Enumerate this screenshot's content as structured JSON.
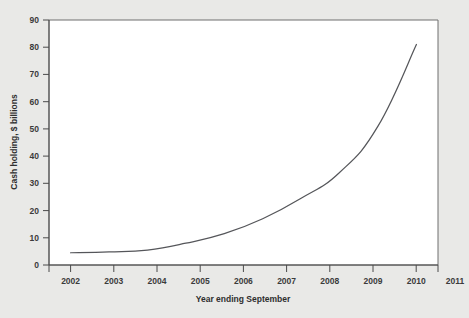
{
  "chart_data": {
    "type": "line",
    "title": "",
    "xlabel": "Year ending September",
    "ylabel": "Cash holding, $ billions",
    "categories": [
      "2002",
      "2003",
      "2004",
      "2005",
      "2006",
      "2007",
      "2008",
      "2009",
      "2010",
      "2011"
    ],
    "x": [
      2002,
      2003,
      2004,
      2005,
      2006,
      2007,
      2008,
      2009,
      2010,
      2011
    ],
    "values": [
      4.5,
      4.8,
      5.5,
      8.0,
      11.5,
      17.0,
      24.5,
      34.0,
      51.0,
      81.0
    ],
    "series": [
      {
        "name": "Cash holding",
        "values": [
          4.5,
          4.8,
          5.5,
          8.0,
          11.5,
          17.0,
          24.5,
          34.0,
          51.0,
          81.0
        ],
        "color": "#55565a"
      }
    ],
    "ylim": [
      0,
      90
    ],
    "xlim": [
      2002,
      2011
    ],
    "yticks": [
      0,
      10,
      20,
      30,
      40,
      50,
      60,
      70,
      80,
      90
    ],
    "ytick_labels": [
      "0",
      "10",
      "20",
      "30",
      "40",
      "50",
      "60",
      "70",
      "80",
      "90"
    ],
    "xticks": [
      2002,
      2003,
      2004,
      2005,
      2006,
      2007,
      2008,
      2009,
      2010,
      2011
    ],
    "xtick_labels": [
      "2002",
      "2003",
      "2004",
      "2005",
      "2006",
      "2007",
      "2008",
      "2009",
      "2010",
      "2011"
    ],
    "grid": false,
    "legend": false,
    "legend_position": "none",
    "plot_background": "#ffffff",
    "page_background": "#e9e9e7",
    "frame_color": "#6e6e6e",
    "axis_color": "#4a4a4a"
  }
}
